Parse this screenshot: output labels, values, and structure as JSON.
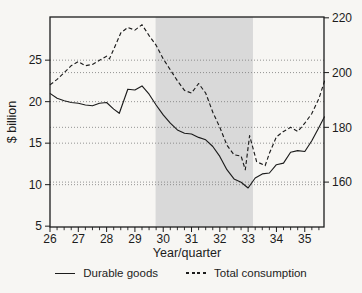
{
  "figure": {
    "background": "#f7f6f3",
    "ylabel_left": "$ billion",
    "xlabel": "Year/quarter"
  },
  "legend": [
    {
      "label": "Durable goods",
      "style": "solid"
    },
    {
      "label": "Total consumption",
      "style": "dashed"
    }
  ],
  "chart_data": {
    "type": "line",
    "title": "",
    "xlabel": "Year/quarter",
    "ylabel_left": "$ billion",
    "ylabel_right": "",
    "x_ticks": [
      26,
      27,
      28,
      29,
      30,
      31,
      32,
      33,
      34,
      35
    ],
    "x_minor_step": 0.25,
    "xlim": [
      26,
      35.68
    ],
    "left_ylim": [
      4.9,
      30.2
    ],
    "right_ylim": [
      143.6,
      220.3
    ],
    "left_ticks": [
      5,
      10,
      15,
      20,
      25
    ],
    "right_ticks": [
      160,
      180,
      200,
      220
    ],
    "gridlines_left": [
      10,
      15,
      20,
      25
    ],
    "gridlines_right": [
      160,
      180,
      200
    ],
    "grid_color": "#7a7a7a",
    "line_color": "#1c1c1c",
    "shaded_band": {
      "x0": 29.73,
      "x1": 33.17,
      "color": "#d9d9d9"
    },
    "legend_position": "bottom",
    "series": [
      {
        "name": "Durable goods",
        "axis": "left",
        "line": "solid",
        "color": "#1c1c1c",
        "x": [
          26,
          26.25,
          26.5,
          26.75,
          27,
          27.25,
          27.5,
          27.75,
          28,
          28.25,
          28.45,
          28.75,
          29,
          29.25,
          29.5,
          29.75,
          30,
          30.25,
          30.5,
          30.75,
          31,
          31.25,
          31.5,
          31.75,
          32,
          32.25,
          32.5,
          32.75,
          33,
          33.25,
          33.5,
          33.75,
          34,
          34.25,
          34.5,
          34.75,
          35,
          35.25,
          35.5,
          35.7
        ],
        "y": [
          21.0,
          20.4,
          20.1,
          19.9,
          19.8,
          19.6,
          19.5,
          19.8,
          19.9,
          19.1,
          18.6,
          21.5,
          21.4,
          21.9,
          20.9,
          19.6,
          18.4,
          17.4,
          16.6,
          16.2,
          16.1,
          15.7,
          15.4,
          14.6,
          13.4,
          11.8,
          10.7,
          10.3,
          9.6,
          10.8,
          11.3,
          11.4,
          12.4,
          12.6,
          13.9,
          14.1,
          14.0,
          15.3,
          16.9,
          18.2
        ]
      },
      {
        "name": "Total consumption",
        "axis": "right",
        "line": "dashed",
        "color": "#1c1c1c",
        "x": [
          26,
          26.25,
          26.5,
          26.75,
          27,
          27.25,
          27.5,
          27.75,
          28,
          28.1,
          28.25,
          28.5,
          28.75,
          29,
          29.25,
          29.5,
          29.75,
          30,
          30.25,
          30.5,
          30.75,
          31,
          31.25,
          31.5,
          31.75,
          32,
          32.25,
          32.5,
          32.75,
          32.9,
          33.05,
          33.3,
          33.6,
          33.75,
          34,
          34.25,
          34.5,
          34.75,
          35,
          35.25,
          35.5,
          35.7
        ],
        "y": [
          195.5,
          197.5,
          200,
          202.5,
          204,
          202.5,
          203,
          204.5,
          206,
          205,
          208.5,
          214.5,
          216.5,
          215.5,
          217.5,
          213.5,
          210,
          205,
          201,
          197,
          193.5,
          192.5,
          196,
          192.5,
          185.5,
          180,
          173.5,
          170,
          169.5,
          164.5,
          177,
          167.5,
          166,
          170.5,
          176.5,
          178.5,
          180,
          178.5,
          181.5,
          185,
          190.5,
          197
        ]
      }
    ]
  }
}
